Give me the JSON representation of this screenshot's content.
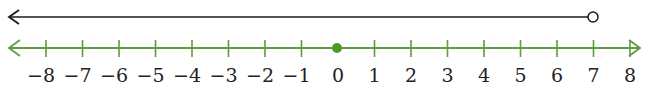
{
  "diagram": {
    "type": "number-line",
    "colors": {
      "solution_ray": "#1a1a1a",
      "axis": "#5a9e3e",
      "dot": "#4a9a2e",
      "label": "#222222"
    },
    "solution_ray": {
      "direction": "left",
      "endpoint": 7,
      "endpoint_style": "open-circle"
    },
    "axis": {
      "min": -8,
      "max": 8,
      "arrows": "both"
    },
    "marked_point": {
      "value": 0,
      "style": "closed-dot"
    },
    "tick_labels": [
      "−8",
      "−7",
      "−6",
      "−5",
      "−4",
      "−3",
      "−2",
      "−1",
      "0",
      "1",
      "2",
      "3",
      "4",
      "5",
      "6",
      "7",
      "8"
    ]
  }
}
